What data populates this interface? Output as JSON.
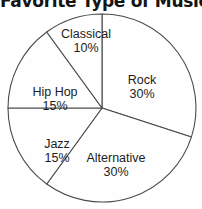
{
  "chart_data": {
    "type": "pie",
    "title": "Favorite Type of Music",
    "xlabel": "",
    "ylabel": "",
    "categories": [
      "Rock",
      "Alternative",
      "Jazz",
      "Hip Hop",
      "Classical"
    ],
    "values": [
      30,
      30,
      15,
      15,
      10
    ],
    "value_unit": "%",
    "legend": "none",
    "grid": false,
    "slices": [
      {
        "label": "Rock",
        "percent": 30,
        "percent_text": "30%",
        "start_angle": 0,
        "end_angle": 108,
        "color": "#fefefe"
      },
      {
        "label": "Alternative",
        "percent": 30,
        "percent_text": "30%",
        "start_angle": 108,
        "end_angle": 216,
        "color": "#fefefe"
      },
      {
        "label": "Jazz",
        "percent": 15,
        "percent_text": "15%",
        "start_angle": 216,
        "end_angle": 270,
        "color": "#fefefe"
      },
      {
        "label": "Hip Hop",
        "percent": 15,
        "percent_text": "15%",
        "start_angle": 270,
        "end_angle": 324,
        "color": "#fefefe"
      },
      {
        "label": "Classical",
        "percent": 10,
        "percent_text": "10%",
        "start_angle": 324,
        "end_angle": 360,
        "color": "#fefefe"
      }
    ],
    "outline_color": "#4a4a4a",
    "background_color": "#ffffff"
  }
}
